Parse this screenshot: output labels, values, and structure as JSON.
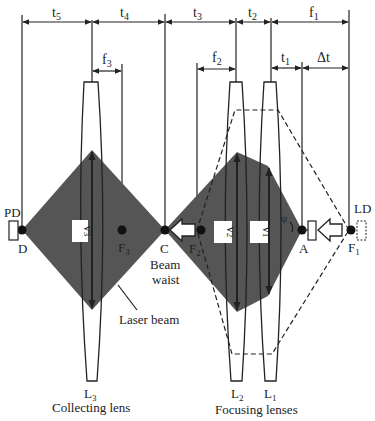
{
  "diagram": {
    "type": "optical-schematic",
    "colors": {
      "beam": "#555555",
      "line": "#222222",
      "background": "#ffffff"
    },
    "dimensions_top": [
      {
        "label": "t",
        "sub": "5"
      },
      {
        "label": "t",
        "sub": "4"
      },
      {
        "label": "t",
        "sub": "3"
      },
      {
        "label": "t",
        "sub": "2"
      },
      {
        "label": "f",
        "sub": "1"
      }
    ],
    "dimensions_second": [
      {
        "label": "f",
        "sub": "3"
      },
      {
        "label": "f",
        "sub": "2"
      },
      {
        "label": "t",
        "sub": "1"
      },
      {
        "label": "Δt",
        "sub": ""
      }
    ],
    "points": {
      "D": "D",
      "F3": "F",
      "F3_sub": "3",
      "C": "C",
      "F2": "F",
      "F2_sub": "2",
      "A": "A",
      "F1": "F",
      "F1_sub": "1",
      "psi": "ψ"
    },
    "components": {
      "PD": "PD",
      "LD": "LD"
    },
    "velocities": [
      {
        "label": "v",
        "sub": "3"
      },
      {
        "label": "v",
        "sub": "2"
      },
      {
        "label": "v",
        "sub": "1"
      }
    ],
    "annotations": {
      "beam_waist_1": "Beam",
      "beam_waist_2": "waist",
      "laser_beam": "Laser beam"
    },
    "lenses": [
      {
        "label": "L",
        "sub": "3",
        "caption": "Collecting lens"
      },
      {
        "label": "L",
        "sub": "2"
      },
      {
        "label": "L",
        "sub": "1",
        "caption": "Focusing lenses"
      }
    ]
  }
}
